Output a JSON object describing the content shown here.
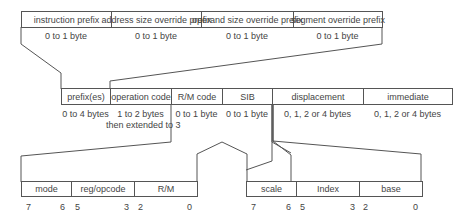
{
  "prefix_row": {
    "fields": [
      {
        "name": "instruction prefix",
        "size": "0 to 1 byte"
      },
      {
        "name": "address size override prefix",
        "size": "0 to 1 byte"
      },
      {
        "name": "operand size override prefix",
        "size": "0 to 1 byte"
      },
      {
        "name": "segment override prefix",
        "size": "0 to 1 byte"
      }
    ]
  },
  "instruction_row": {
    "fields": [
      {
        "name": "prefix(es)",
        "size": "0 to 4 bytes"
      },
      {
        "name": "operation code",
        "size": "1 to 2 bytes",
        "size_line2": "then extended to 3"
      },
      {
        "name": "R/M code",
        "size": "0 to 1 byte"
      },
      {
        "name": "SIB",
        "size": "0 to 1 byte"
      },
      {
        "name": "displacement",
        "size": "0, 1, 2 or 4 bytes"
      },
      {
        "name": "immediate",
        "size": "0, 1, 2 or 4 bytes"
      }
    ]
  },
  "modrm_row": {
    "fields": [
      {
        "name": "mode",
        "bit_hi": "7",
        "bit_lo": "6"
      },
      {
        "name": "reg/opcode",
        "bit_hi": "5",
        "bit_lo": "3"
      },
      {
        "name": "R/M",
        "bit_hi": "2",
        "bit_lo": "0"
      }
    ]
  },
  "sib_row": {
    "fields": [
      {
        "name": "scale",
        "bit_hi": "7",
        "bit_lo": "6"
      },
      {
        "name": "Index",
        "bit_hi": "5",
        "bit_lo": "3"
      },
      {
        "name": "base",
        "bit_hi": "2",
        "bit_lo": "0"
      }
    ]
  }
}
